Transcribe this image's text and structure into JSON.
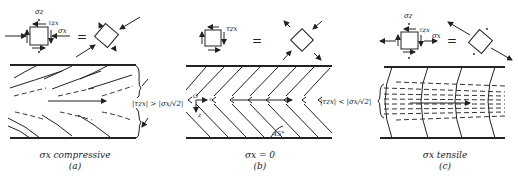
{
  "figure": {
    "panels": [
      {
        "id": "a",
        "sigma_z_label": "σz",
        "tau_label": "τzx",
        "sigma_x_label": "σx",
        "equals": "=",
        "condition": "|τzx| > |σx/√2|",
        "caption": "σx compressive",
        "letter": "(a)"
      },
      {
        "id": "b",
        "tau_label": "τzx",
        "equals": "=",
        "origin_label": "O",
        "x_axis_label": "x",
        "z_axis_label": "z",
        "angle_label": "45°",
        "caption": "σx = 0",
        "letter": "(b)"
      },
      {
        "id": "c",
        "sigma_z_label": "σz",
        "tau_label": "τzx",
        "sigma_x_label": "σx",
        "equals": "=",
        "condition": "|τzx| < |σx/√2|",
        "caption": "σx tensile",
        "letter": "(c)"
      }
    ]
  }
}
